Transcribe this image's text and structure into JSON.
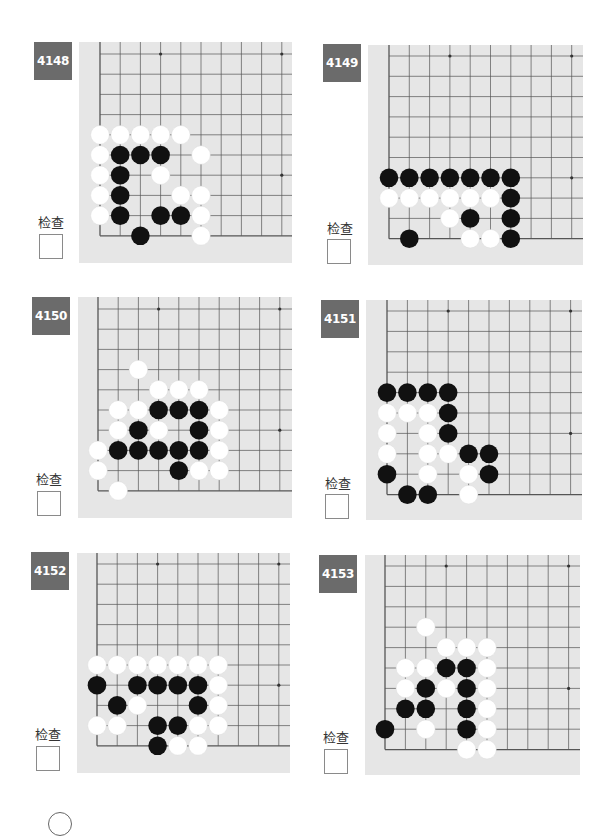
{
  "page": {
    "check_label": "检查",
    "colors": {
      "badge_bg": "#6b6b6b",
      "board_bg": "#e6e6e6",
      "grid_line": "#555555",
      "black_stone": "#111111",
      "white_stone": "#ffffff"
    }
  },
  "problems": [
    {
      "id": "4148",
      "badge": {
        "x": 34,
        "y": 42
      },
      "label_pos": {
        "x": 31,
        "y": 212
      },
      "checkbox": {
        "x": 39,
        "y": 234
      },
      "board": {
        "x": 79,
        "y": 42,
        "w": 213,
        "h": 221
      },
      "grid": {
        "x0": 100,
        "y0": 54,
        "step": 20.2
      },
      "hoshi": [
        [
          3,
          0
        ],
        [
          9,
          0
        ],
        [
          9,
          6
        ]
      ],
      "stones": {
        "white": [
          [
            0,
            4
          ],
          [
            1,
            4
          ],
          [
            2,
            4
          ],
          [
            3,
            4
          ],
          [
            4,
            4
          ],
          [
            0,
            5
          ],
          [
            5,
            5
          ],
          [
            0,
            6
          ],
          [
            3,
            6
          ],
          [
            0,
            7
          ],
          [
            4,
            7
          ],
          [
            5,
            7
          ],
          [
            0,
            8
          ],
          [
            5,
            8
          ],
          [
            5,
            9
          ]
        ],
        "black": [
          [
            1,
            5
          ],
          [
            2,
            5
          ],
          [
            3,
            5
          ],
          [
            1,
            6
          ],
          [
            1,
            7
          ],
          [
            1,
            8
          ],
          [
            3,
            8
          ],
          [
            4,
            8
          ],
          [
            2,
            9
          ]
        ]
      }
    },
    {
      "id": "4149",
      "badge": {
        "x": 323,
        "y": 44
      },
      "label_pos": {
        "x": 320,
        "y": 218
      },
      "checkbox": {
        "x": 327,
        "y": 239
      },
      "board": {
        "x": 368,
        "y": 45,
        "w": 215,
        "h": 220
      },
      "grid": {
        "x0": 389,
        "y0": 56,
        "step": 20.3
      },
      "hoshi": [
        [
          3,
          0
        ],
        [
          9,
          0
        ],
        [
          9,
          6
        ]
      ],
      "stones": {
        "white": [
          [
            0,
            7
          ],
          [
            1,
            7
          ],
          [
            2,
            7
          ],
          [
            3,
            7
          ],
          [
            4,
            7
          ],
          [
            5,
            7
          ],
          [
            3,
            8
          ],
          [
            4,
            9
          ],
          [
            5,
            9
          ]
        ],
        "black": [
          [
            0,
            6
          ],
          [
            1,
            6
          ],
          [
            2,
            6
          ],
          [
            3,
            6
          ],
          [
            4,
            6
          ],
          [
            5,
            6
          ],
          [
            6,
            6
          ],
          [
            6,
            7
          ],
          [
            4,
            8
          ],
          [
            6,
            8
          ],
          [
            1,
            9
          ],
          [
            6,
            9
          ]
        ]
      }
    },
    {
      "id": "4150",
      "badge": {
        "x": 32,
        "y": 297
      },
      "label_pos": {
        "x": 29,
        "y": 469
      },
      "checkbox": {
        "x": 37,
        "y": 491
      },
      "board": {
        "x": 78,
        "y": 297,
        "w": 214,
        "h": 221
      },
      "grid": {
        "x0": 98,
        "y0": 309,
        "step": 20.2
      },
      "hoshi": [
        [
          3,
          0
        ],
        [
          9,
          0
        ],
        [
          9,
          6
        ]
      ],
      "stones": {
        "white": [
          [
            2,
            3
          ],
          [
            3,
            4
          ],
          [
            4,
            4
          ],
          [
            5,
            4
          ],
          [
            1,
            5
          ],
          [
            2,
            5
          ],
          [
            6,
            5
          ],
          [
            1,
            6
          ],
          [
            3,
            6
          ],
          [
            6,
            6
          ],
          [
            0,
            7
          ],
          [
            6,
            7
          ],
          [
            0,
            8
          ],
          [
            5,
            8
          ],
          [
            6,
            8
          ],
          [
            1,
            9
          ]
        ],
        "black": [
          [
            3,
            5
          ],
          [
            4,
            5
          ],
          [
            5,
            5
          ],
          [
            2,
            6
          ],
          [
            5,
            6
          ],
          [
            1,
            7
          ],
          [
            2,
            7
          ],
          [
            3,
            7
          ],
          [
            4,
            7
          ],
          [
            5,
            7
          ],
          [
            4,
            8
          ]
        ]
      }
    },
    {
      "id": "4151",
      "badge": {
        "x": 321,
        "y": 300
      },
      "label_pos": {
        "x": 318,
        "y": 473
      },
      "checkbox": {
        "x": 325,
        "y": 494
      },
      "board": {
        "x": 366,
        "y": 300,
        "w": 216,
        "h": 220
      },
      "grid": {
        "x0": 387,
        "y0": 311,
        "step": 20.4
      },
      "hoshi": [
        [
          3,
          0
        ],
        [
          9,
          0
        ],
        [
          9,
          6
        ]
      ],
      "stones": {
        "white": [
          [
            0,
            5
          ],
          [
            1,
            5
          ],
          [
            2,
            5
          ],
          [
            0,
            6
          ],
          [
            2,
            6
          ],
          [
            0,
            7
          ],
          [
            2,
            7
          ],
          [
            3,
            7
          ],
          [
            2,
            8
          ],
          [
            4,
            8
          ],
          [
            4,
            9
          ]
        ],
        "black": [
          [
            0,
            4
          ],
          [
            1,
            4
          ],
          [
            2,
            4
          ],
          [
            3,
            4
          ],
          [
            3,
            5
          ],
          [
            3,
            6
          ],
          [
            4,
            7
          ],
          [
            5,
            7
          ],
          [
            0,
            8
          ],
          [
            5,
            8
          ],
          [
            1,
            9
          ],
          [
            2,
            9
          ]
        ]
      }
    },
    {
      "id": "4152",
      "badge": {
        "x": 31,
        "y": 552
      },
      "label_pos": {
        "x": 28,
        "y": 724
      },
      "checkbox": {
        "x": 36,
        "y": 746
      },
      "board": {
        "x": 77,
        "y": 553,
        "w": 213,
        "h": 220
      },
      "grid": {
        "x0": 97,
        "y0": 564,
        "step": 20.2
      },
      "hoshi": [
        [
          3,
          0
        ],
        [
          9,
          0
        ],
        [
          9,
          6
        ]
      ],
      "stones": {
        "white": [
          [
            0,
            5
          ],
          [
            1,
            5
          ],
          [
            2,
            5
          ],
          [
            3,
            5
          ],
          [
            4,
            5
          ],
          [
            5,
            5
          ],
          [
            6,
            5
          ],
          [
            6,
            6
          ],
          [
            2,
            7
          ],
          [
            6,
            7
          ],
          [
            0,
            8
          ],
          [
            1,
            8
          ],
          [
            5,
            8
          ],
          [
            6,
            8
          ],
          [
            4,
            9
          ],
          [
            5,
            9
          ]
        ],
        "black": [
          [
            0,
            6
          ],
          [
            2,
            6
          ],
          [
            3,
            6
          ],
          [
            4,
            6
          ],
          [
            5,
            6
          ],
          [
            1,
            7
          ],
          [
            5,
            7
          ],
          [
            3,
            8
          ],
          [
            4,
            8
          ],
          [
            3,
            9
          ]
        ]
      }
    },
    {
      "id": "4153",
      "badge": {
        "x": 319,
        "y": 555
      },
      "label_pos": {
        "x": 316,
        "y": 727
      },
      "checkbox": {
        "x": 324,
        "y": 749
      },
      "board": {
        "x": 365,
        "y": 555,
        "w": 215,
        "h": 220
      },
      "grid": {
        "x0": 385,
        "y0": 566,
        "step": 20.4
      },
      "hoshi": [
        [
          3,
          0
        ],
        [
          9,
          0
        ],
        [
          9,
          6
        ]
      ],
      "stones": {
        "white": [
          [
            2,
            3
          ],
          [
            3,
            4
          ],
          [
            4,
            4
          ],
          [
            5,
            4
          ],
          [
            1,
            5
          ],
          [
            2,
            5
          ],
          [
            5,
            5
          ],
          [
            1,
            6
          ],
          [
            3,
            6
          ],
          [
            5,
            6
          ],
          [
            5,
            7
          ],
          [
            2,
            8
          ],
          [
            5,
            8
          ],
          [
            4,
            9
          ],
          [
            5,
            9
          ]
        ],
        "black": [
          [
            3,
            5
          ],
          [
            4,
            5
          ],
          [
            2,
            6
          ],
          [
            4,
            6
          ],
          [
            1,
            7
          ],
          [
            2,
            7
          ],
          [
            4,
            7
          ],
          [
            0,
            8
          ],
          [
            4,
            8
          ]
        ]
      }
    }
  ]
}
